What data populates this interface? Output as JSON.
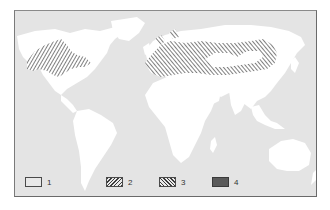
{
  "map": {
    "type": "world-map",
    "projection": "equirectangular",
    "colors": {
      "ocean": "#e4e4e4",
      "land": "#ffffff",
      "hatch": "#3a3a3a",
      "frame": "#6a6a6a",
      "solid_fill": "#5a5a5a"
    },
    "regions": [
      {
        "name": "North America (USA/Canada)",
        "category": "2",
        "pattern": "forward-hatch"
      },
      {
        "name": "Europe to Central Asia / Russia",
        "category": "3",
        "pattern": "back-hatch"
      }
    ]
  },
  "legend": {
    "items": [
      {
        "label": "1",
        "pattern": "empty"
      },
      {
        "label": "2",
        "pattern": "forward-hatch"
      },
      {
        "label": "3",
        "pattern": "back-hatch"
      },
      {
        "label": "4",
        "pattern": "solid"
      }
    ]
  }
}
